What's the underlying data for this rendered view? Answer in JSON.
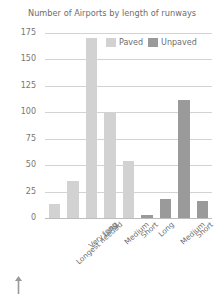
{
  "chart_data": {
    "type": "bar",
    "title": "Number of Airports by length of runways",
    "xlabel": "",
    "ylabel": "",
    "ylim": [
      0,
      175
    ],
    "yticks": [
      0,
      25,
      50,
      75,
      100,
      125,
      150,
      175
    ],
    "grid": true,
    "legend_position": "top-right",
    "categories": [
      "Longest needed",
      "Very long",
      "Long",
      "Medium",
      "Short",
      "Long",
      "Medium",
      "Short",
      "Heliports"
    ],
    "series": [
      {
        "name": "Paved",
        "color": "#d2d2d2",
        "values": [
          13,
          35,
          170,
          99,
          54,
          null,
          null,
          null,
          null
        ]
      },
      {
        "name": "Unpaved",
        "color": "#9a9a9a",
        "values": [
          null,
          null,
          null,
          null,
          null,
          3,
          18,
          112,
          16
        ]
      }
    ],
    "bars": [
      {
        "label": "Longest needed",
        "series": "Paved",
        "value": 13,
        "color": "#d2d2d2"
      },
      {
        "label": "Very long",
        "series": "Paved",
        "value": 35,
        "color": "#d2d2d2"
      },
      {
        "label": "Long",
        "series": "Paved",
        "value": 170,
        "color": "#d2d2d2"
      },
      {
        "label": "Medium",
        "series": "Paved",
        "value": 99,
        "color": "#d2d2d2"
      },
      {
        "label": "Short",
        "series": "Paved",
        "value": 54,
        "color": "#d2d2d2"
      },
      {
        "label": "Long",
        "series": "Unpaved",
        "value": 3,
        "color": "#9a9a9a"
      },
      {
        "label": "Medium",
        "series": "Unpaved",
        "value": 18,
        "color": "#9a9a9a"
      },
      {
        "label": "Short",
        "series": "Unpaved",
        "value": 112,
        "color": "#9a9a9a"
      },
      {
        "label": "Heliports",
        "series": "Unpaved",
        "value": 16,
        "color": "#9a9a9a"
      }
    ]
  },
  "legend": {
    "items": [
      {
        "label": "Paved",
        "color": "#d2d2d2"
      },
      {
        "label": "Unpaved",
        "color": "#9a9a9a"
      }
    ]
  },
  "axis": {
    "ytick_labels": [
      "175",
      "150",
      "125",
      "100",
      "75",
      "50",
      "25",
      "0"
    ]
  },
  "colors": {
    "paved": "#d2d2d2",
    "unpaved": "#9a9a9a",
    "gridline": "#d3d3d3",
    "text": "#6d6d6d",
    "background": "#ffffff",
    "arrow": "#9a9a9a"
  }
}
